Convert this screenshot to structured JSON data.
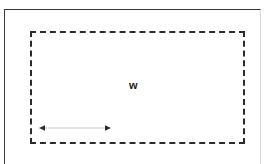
{
  "figure": {
    "background_color": "#ffffff",
    "outer_frame": {
      "style": "solid",
      "color": "#3a3a3a",
      "right_edge_color": "#d9d9d9",
      "thickness_px": 1
    },
    "dashed_rect": {
      "style": "dashed",
      "color": "#2b2b2b",
      "thickness_px": 2,
      "dash_length_px": 11,
      "gap_length_px": 5
    },
    "labels": {
      "width_label": "w"
    },
    "arrow": {
      "name": "width-measure-arrow",
      "direction": "double-headed",
      "orientation": "horizontal",
      "shaft_color": "#c9c9c9",
      "head_color": "#2b2b2b",
      "length_px": 71
    }
  }
}
